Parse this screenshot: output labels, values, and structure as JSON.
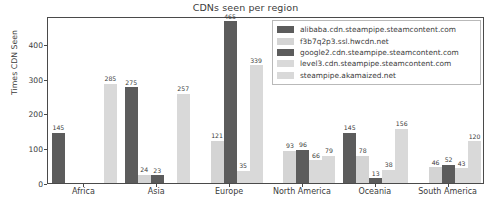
{
  "chart_data": {
    "type": "bar",
    "title": "CDNs seen per region",
    "xlabel": "",
    "ylabel": "Times CDN Seen",
    "categories": [
      "Africa",
      "Asia",
      "Europe",
      "North America",
      "Oceania",
      "South America"
    ],
    "ylim": [
      0,
      480
    ],
    "yticks": [
      0,
      100,
      200,
      300,
      400
    ],
    "ytick_labels": [
      "0",
      "100",
      "200",
      "300",
      "400"
    ],
    "grid": false,
    "legend_position": "upper right",
    "series": [
      {
        "name": "alibaba.cdn.steampipe.steamcontent.com",
        "color": "#5c5c5c",
        "values": [
          145,
          275,
          null,
          null,
          145,
          null
        ]
      },
      {
        "name": "f3b7q2p3.ssl.hwcdn.net",
        "color": "#d4d4d4",
        "values": [
          null,
          24,
          121,
          93,
          78,
          46
        ]
      },
      {
        "name": "google2.cdn.steampipe.steamcontent.com",
        "color": "#5c5c5c",
        "values": [
          null,
          23,
          465,
          96,
          13,
          52
        ]
      },
      {
        "name": "level3.cdn.steampipe.steamcontent.com",
        "color": "#d9d9d9",
        "values": [
          null,
          null,
          35,
          66,
          38,
          43
        ]
      },
      {
        "name": "steampipe.akamaized.net",
        "color": "#d9d9d9",
        "values": [
          285,
          257,
          339,
          79,
          156,
          120
        ]
      }
    ]
  },
  "legend": {
    "items": [
      {
        "label": "alibaba.cdn.steampipe.steamcontent.com",
        "color": "#5c5c5c"
      },
      {
        "label": "f3b7q2p3.ssl.hwcdn.net",
        "color": "#d4d4d4"
      },
      {
        "label": "google2.cdn.steampipe.steamcontent.com",
        "color": "#5c5c5c"
      },
      {
        "label": "level3.cdn.steampipe.steamcontent.com",
        "color": "#d9d9d9"
      },
      {
        "label": "steampipe.akamaized.net",
        "color": "#d9d9d9"
      }
    ]
  }
}
